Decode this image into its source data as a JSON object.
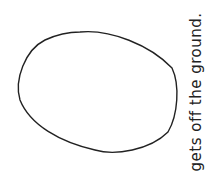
{
  "drawing": {
    "shape": "oval",
    "stroke_color": "#222222",
    "background": "#ffffff"
  },
  "caption": {
    "text": "gets off the ground."
  }
}
